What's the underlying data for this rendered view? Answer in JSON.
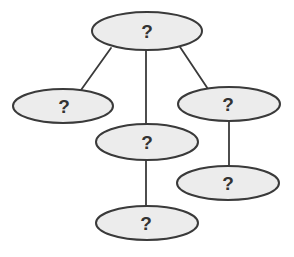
{
  "diagram": {
    "type": "tree",
    "colors": {
      "node_fill": "#ececec",
      "node_stroke": "#3a3a3a",
      "edge": "#3a3a3a",
      "label": "#333333",
      "background": "#ffffff"
    },
    "nodes": [
      {
        "id": "root",
        "label": "?"
      },
      {
        "id": "left",
        "label": "?"
      },
      {
        "id": "middle",
        "label": "?"
      },
      {
        "id": "right",
        "label": "?"
      },
      {
        "id": "right-child",
        "label": "?"
      },
      {
        "id": "middle-child",
        "label": "?"
      }
    ],
    "edges": [
      {
        "from": "root",
        "to": "left"
      },
      {
        "from": "root",
        "to": "middle"
      },
      {
        "from": "root",
        "to": "right"
      },
      {
        "from": "middle",
        "to": "middle-child"
      },
      {
        "from": "right",
        "to": "right-child"
      }
    ]
  }
}
